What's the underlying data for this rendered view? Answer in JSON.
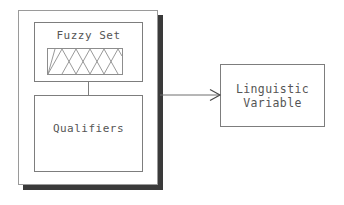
{
  "diagram": {
    "background_color": "#ffffff",
    "stroke_color": "#7d7d7d",
    "text_color": "#555555",
    "shadow_color": "#3a3a3a",
    "group": {
      "label": "",
      "shadow": "drop-shadow"
    },
    "nodes": {
      "fuzzy_set": {
        "label": "Fuzzy Set",
        "plot": {
          "type": "membership-functions",
          "shape": "triangular",
          "peak_count": 5,
          "has_edge_shoulders": true,
          "axis_labels": [],
          "tick_labels": []
        }
      },
      "qualifiers": {
        "label": "Qualifiers"
      },
      "linguistic_variable": {
        "label_line_1": "Linguistic",
        "label_line_2": "Variable"
      }
    },
    "edges": {
      "fuzzy_to_qualifiers": {
        "style": "plain-line",
        "arrowhead": "none"
      },
      "group_to_variable": {
        "style": "plain-line",
        "arrowhead": "open-v"
      }
    }
  }
}
